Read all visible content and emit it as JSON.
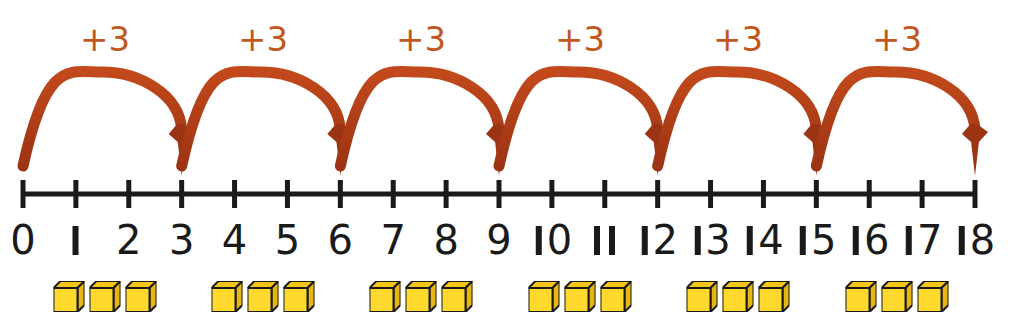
{
  "diagram": {
    "colors": {
      "arrow": "#b03a16",
      "arrow_dark": "#9c3413",
      "label": "#c1571f",
      "axis": "#1a1a1a",
      "cube_front": "#ffd92e",
      "cube_top": "#f5c518",
      "cube_side": "#e8b613",
      "cube_outline": "#1a1a1a",
      "background": "#ffffff"
    },
    "axis": {
      "start_value": 0,
      "end_value": 18,
      "step": 1,
      "x_start_px": 23,
      "x_end_px": 975,
      "y_px": 194,
      "tick_top_px": 180,
      "tick_bottom_px": 208,
      "line_width_px": 5,
      "tick_width_px": 5
    },
    "tick_labels": [
      "0",
      "1",
      "2",
      "3",
      "4",
      "5",
      "6",
      "7",
      "8",
      "9",
      "10",
      "11",
      "12",
      "13",
      "14",
      "15",
      "16",
      "17",
      "18"
    ],
    "tick_label_y_px": 220,
    "jumps": [
      {
        "label": "+3",
        "from": 0,
        "to": 3,
        "label_x_px": 105,
        "label_y_px": 22
      },
      {
        "label": "+3",
        "from": 3,
        "to": 6,
        "label_x_px": 263,
        "label_y_px": 22
      },
      {
        "label": "+3",
        "from": 6,
        "to": 9,
        "label_x_px": 421,
        "label_y_px": 22
      },
      {
        "label": "+3",
        "from": 9,
        "to": 12,
        "label_x_px": 580,
        "label_y_px": 22
      },
      {
        "label": "+3",
        "from": 12,
        "to": 15,
        "label_x_px": 738,
        "label_y_px": 22
      },
      {
        "label": "+3",
        "from": 15,
        "to": 18,
        "label_x_px": 897,
        "label_y_px": 22
      }
    ],
    "arc_geometry": {
      "start_y_px": 166,
      "apex_y_px": 72,
      "arrow_tip_y_px": 176,
      "stroke_width_px": 11,
      "arrow_head_width_px": 26,
      "arrow_head_height_px": 46
    },
    "cube_groups": [
      {
        "count": 3,
        "center_x_px": 105,
        "represents": 3
      },
      {
        "count": 3,
        "center_x_px": 263,
        "represents": 3
      },
      {
        "count": 3,
        "center_x_px": 421,
        "represents": 3
      },
      {
        "count": 3,
        "center_x_px": 580,
        "represents": 3
      },
      {
        "count": 3,
        "center_x_px": 738,
        "represents": 3
      },
      {
        "count": 3,
        "center_x_px": 897,
        "represents": 3
      }
    ],
    "cube_row_y_px": 281,
    "cube_size_px": 24
  }
}
